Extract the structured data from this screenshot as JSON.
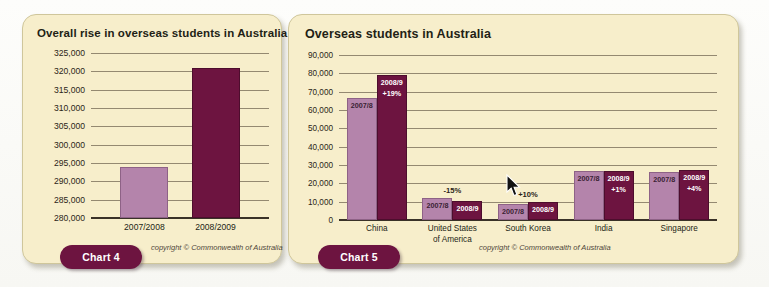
{
  "chart_data": [
    {
      "type": "bar",
      "id": "chart4",
      "title": "Overall rise in overseas students in Australia",
      "categories": [
        "2007/2008",
        "2008/2009"
      ],
      "values": [
        294000,
        320800
      ],
      "bar_colors": [
        "#b484ab",
        "#6d1440"
      ],
      "ylim": [
        280000,
        325000
      ],
      "yticks": [
        "325,000",
        "320,000",
        "315,000",
        "310,000",
        "305,000",
        "300,000",
        "295,000",
        "290,000",
        "285,000",
        "280,000"
      ],
      "ytick_values": [
        325000,
        320000,
        315000,
        310000,
        305000,
        300000,
        295000,
        290000,
        285000,
        280000
      ],
      "xlabel": "",
      "ylabel": "",
      "grid": true,
      "legend": "none",
      "copyright": "copyright © Commonwealth of Australia",
      "badge": "Chart 4"
    },
    {
      "type": "bar",
      "id": "chart5",
      "title": "Overseas students in Australia",
      "categories": [
        "China",
        "United States\nof America",
        "South Korea",
        "India",
        "Singapore"
      ],
      "category_labels": [
        [
          "China"
        ],
        [
          "United States",
          "of America"
        ],
        [
          "South Korea"
        ],
        [
          "India"
        ],
        [
          "Singapore"
        ]
      ],
      "series": [
        {
          "name": "2007/8",
          "values": [
            66500,
            12000,
            9000,
            26500,
            26000
          ]
        },
        {
          "name": "2008/9",
          "values": [
            79000,
            10200,
            9900,
            27000,
            27200
          ]
        }
      ],
      "change_labels": [
        "+19%",
        "-15%",
        "+10%",
        "+1%",
        "+4%"
      ],
      "change_label_position": [
        "inside",
        "above",
        "above",
        "inside",
        "inside"
      ],
      "bar_colors": [
        "#b484ab",
        "#6d1440"
      ],
      "ylim": [
        0,
        90000
      ],
      "yticks": [
        "90,000",
        "80,000",
        "70,000",
        "60,000",
        "50,000",
        "40,000",
        "30,000",
        "20,000",
        "10,000",
        "0"
      ],
      "ytick_values": [
        90000,
        80000,
        70000,
        60000,
        50000,
        40000,
        30000,
        20000,
        10000,
        0
      ],
      "xlabel": "",
      "ylabel": "",
      "grid": true,
      "legend": "none",
      "copyright": "copyright © Commonwealth of Australia",
      "badge": "Chart 5"
    }
  ],
  "chart4": {
    "title": "Overall rise in overseas students in Australia",
    "copyright": "copyright © Commonwealth of Australia",
    "badge": "Chart 4",
    "yticks": [
      "325,000",
      "320,000",
      "315,000",
      "310,000",
      "305,000",
      "300,000",
      "295,000",
      "290,000",
      "285,000",
      "280,000"
    ],
    "bars": [
      {
        "label": "2007/2008"
      },
      {
        "label": "2008/2009"
      }
    ]
  },
  "chart5": {
    "title": "Overseas students in Australia",
    "copyright": "copyright © Commonwealth of Australia",
    "badge": "Chart 5",
    "yticks": [
      "90,000",
      "80,000",
      "70,000",
      "60,000",
      "50,000",
      "40,000",
      "30,000",
      "20,000",
      "10,000",
      "0"
    ],
    "groups": [
      {
        "name_line1": "China",
        "name_line2": "",
        "left_label": "2007/8",
        "right_label": "2008/9",
        "change": "+19%"
      },
      {
        "name_line1": "United States",
        "name_line2": "of America",
        "left_label": "2007/8",
        "right_label": "2008/9",
        "change": "-15%"
      },
      {
        "name_line1": "South Korea",
        "name_line2": "",
        "left_label": "2007/8",
        "right_label": "2008/9",
        "change": "+10%"
      },
      {
        "name_line1": "India",
        "name_line2": "",
        "left_label": "2007/8",
        "right_label": "2008/9",
        "change": "+1%"
      },
      {
        "name_line1": "Singapore",
        "name_line2": "",
        "left_label": "2007/8",
        "right_label": "2008/9",
        "change": "+4%"
      }
    ]
  },
  "colors": {
    "light_bar": "#b484ab",
    "dark_bar": "#6d1440",
    "panel_bg": "#f7eecb",
    "panel_border": "#cfc69b",
    "badge_bg": "#6d1440",
    "text": "#231f16"
  }
}
